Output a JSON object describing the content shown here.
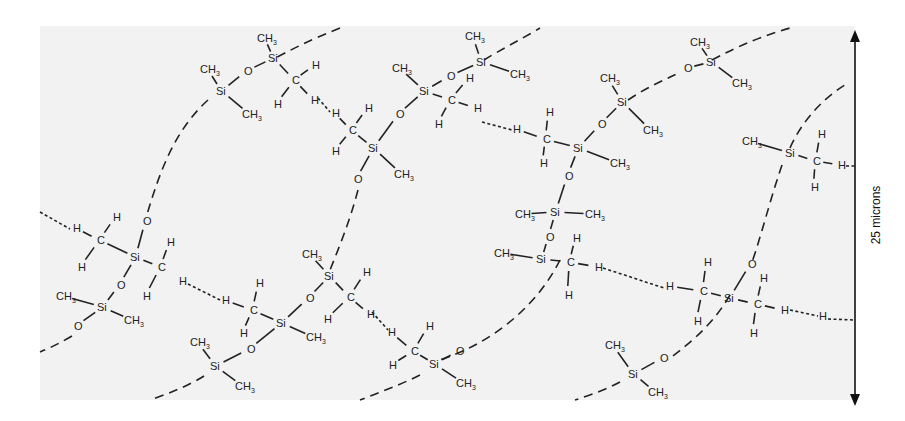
{
  "diagram": {
    "background_color": "#f2f2f2",
    "ink_color": "#222222",
    "scale_bar": {
      "label": "25 microns"
    },
    "atoms": [
      {
        "id": "a1",
        "t": "CH",
        "sub": "3",
        "x": 257,
        "y": 42
      },
      {
        "id": "a2",
        "t": "Si",
        "x": 268,
        "y": 62
      },
      {
        "id": "a3",
        "t": "O",
        "x": 244,
        "y": 75
      },
      {
        "id": "a4",
        "t": "CH",
        "sub": "3",
        "x": 200,
        "y": 73
      },
      {
        "id": "a5",
        "t": "Si",
        "x": 216,
        "y": 95
      },
      {
        "id": "a6",
        "t": "CH",
        "sub": "3",
        "x": 242,
        "y": 118
      },
      {
        "id": "a7",
        "t": "H",
        "x": 312,
        "y": 69
      },
      {
        "id": "a8",
        "t": "C",
        "x": 292,
        "y": 84
      },
      {
        "id": "a9",
        "t": "H",
        "x": 274,
        "y": 108
      },
      {
        "id": "a10",
        "t": "H",
        "x": 311,
        "y": 104
      },
      {
        "id": "b1",
        "t": "H",
        "x": 332,
        "y": 117
      },
      {
        "id": "b2",
        "t": "H",
        "x": 365,
        "y": 112
      },
      {
        "id": "b3",
        "t": "C",
        "x": 349,
        "y": 134
      },
      {
        "id": "b4",
        "t": "H",
        "x": 332,
        "y": 155
      },
      {
        "id": "b5",
        "t": "Si",
        "x": 368,
        "y": 152
      },
      {
        "id": "b6",
        "t": "CH",
        "sub": "3",
        "x": 394,
        "y": 178
      },
      {
        "id": "b7",
        "t": "O",
        "x": 354,
        "y": 183
      },
      {
        "id": "b8",
        "t": "CH",
        "sub": "3",
        "x": 392,
        "y": 72
      },
      {
        "id": "b9",
        "t": "Si",
        "x": 419,
        "y": 95
      },
      {
        "id": "b10",
        "t": "O",
        "x": 396,
        "y": 118
      },
      {
        "id": "b11",
        "t": "O",
        "x": 447,
        "y": 80
      },
      {
        "id": "b12",
        "t": "CH",
        "sub": "3",
        "x": 465,
        "y": 40
      },
      {
        "id": "b13",
        "t": "Si",
        "x": 476,
        "y": 66
      },
      {
        "id": "b14",
        "t": "CH",
        "sub": "3",
        "x": 510,
        "y": 78
      },
      {
        "id": "b15",
        "t": "H",
        "x": 466,
        "y": 82
      },
      {
        "id": "b16",
        "t": "C",
        "x": 448,
        "y": 104
      },
      {
        "id": "b17",
        "t": "H",
        "x": 435,
        "y": 128
      },
      {
        "id": "b18",
        "t": "H",
        "x": 474,
        "y": 112
      },
      {
        "id": "c1",
        "t": "H",
        "x": 513,
        "y": 133
      },
      {
        "id": "c2",
        "t": "H",
        "x": 546,
        "y": 116
      },
      {
        "id": "c3",
        "t": "C",
        "x": 543,
        "y": 143
      },
      {
        "id": "c4",
        "t": "H",
        "x": 540,
        "y": 167
      },
      {
        "id": "c5",
        "t": "Si",
        "x": 573,
        "y": 152
      },
      {
        "id": "c6",
        "t": "CH",
        "sub": "3",
        "x": 610,
        "y": 167
      },
      {
        "id": "c7",
        "t": "O",
        "x": 565,
        "y": 180
      },
      {
        "id": "c8",
        "t": "O",
        "x": 598,
        "y": 128
      },
      {
        "id": "c9",
        "t": "CH",
        "sub": "3",
        "x": 600,
        "y": 82
      },
      {
        "id": "c10",
        "t": "Si",
        "x": 617,
        "y": 106
      },
      {
        "id": "c11",
        "t": "CH",
        "sub": "3",
        "x": 643,
        "y": 134
      },
      {
        "id": "c12",
        "t": "O",
        "x": 684,
        "y": 72
      },
      {
        "id": "c13",
        "t": "CH",
        "sub": "3",
        "x": 690,
        "y": 46
      },
      {
        "id": "c14",
        "t": "Si",
        "x": 706,
        "y": 66
      },
      {
        "id": "c15",
        "t": "CH",
        "sub": "3",
        "x": 732,
        "y": 87
      },
      {
        "id": "d1",
        "t": "CH",
        "sub": "3",
        "x": 742,
        "y": 145
      },
      {
        "id": "d2",
        "t": "Si",
        "x": 785,
        "y": 157
      },
      {
        "id": "d3",
        "t": "H",
        "x": 818,
        "y": 138
      },
      {
        "id": "d4",
        "t": "C",
        "x": 813,
        "y": 165
      },
      {
        "id": "d5",
        "t": "H",
        "x": 811,
        "y": 191
      },
      {
        "id": "d6",
        "t": "H",
        "x": 838,
        "y": 169
      },
      {
        "id": "e1",
        "t": "CH",
        "sub": "3",
        "x": 515,
        "y": 218
      },
      {
        "id": "e2",
        "t": "Si",
        "x": 550,
        "y": 216
      },
      {
        "id": "e3",
        "t": "CH",
        "sub": "3",
        "x": 585,
        "y": 218
      },
      {
        "id": "e4",
        "t": "O",
        "x": 546,
        "y": 241
      },
      {
        "id": "e5",
        "t": "CH",
        "sub": "3",
        "x": 494,
        "y": 257
      },
      {
        "id": "e6",
        "t": "Si",
        "x": 536,
        "y": 263
      },
      {
        "id": "e7",
        "t": "H",
        "x": 573,
        "y": 242
      },
      {
        "id": "e8",
        "t": "C",
        "x": 567,
        "y": 266
      },
      {
        "id": "e9",
        "t": "H",
        "x": 565,
        "y": 299
      },
      {
        "id": "e10",
        "t": "H",
        "x": 595,
        "y": 271
      },
      {
        "id": "f1",
        "t": "H",
        "x": 666,
        "y": 290
      },
      {
        "id": "f2",
        "t": "H",
        "x": 704,
        "y": 266
      },
      {
        "id": "f3",
        "t": "C",
        "x": 700,
        "y": 295
      },
      {
        "id": "f4",
        "t": "H",
        "x": 694,
        "y": 325
      },
      {
        "id": "f5",
        "t": "Si",
        "x": 724,
        "y": 302
      },
      {
        "id": "f6",
        "t": "O",
        "x": 748,
        "y": 268
      },
      {
        "id": "f7",
        "t": "H",
        "x": 760,
        "y": 282
      },
      {
        "id": "f8",
        "t": "C",
        "x": 754,
        "y": 308
      },
      {
        "id": "f9",
        "t": "H",
        "x": 750,
        "y": 337
      },
      {
        "id": "f10",
        "t": "H",
        "x": 781,
        "y": 314
      },
      {
        "id": "f11",
        "t": "H",
        "x": 819,
        "y": 320
      },
      {
        "id": "f12",
        "t": "CH",
        "sub": "3",
        "x": 605,
        "y": 349
      },
      {
        "id": "f13",
        "t": "O",
        "x": 660,
        "y": 362
      },
      {
        "id": "f14",
        "t": "Si",
        "x": 628,
        "y": 378
      },
      {
        "id": "f15",
        "t": "CH",
        "sub": "3",
        "x": 648,
        "y": 396
      },
      {
        "id": "g1",
        "t": "H",
        "x": 73,
        "y": 232
      },
      {
        "id": "g2",
        "t": "H",
        "x": 113,
        "y": 221
      },
      {
        "id": "g3",
        "t": "C",
        "x": 97,
        "y": 244
      },
      {
        "id": "g4",
        "t": "H",
        "x": 78,
        "y": 271
      },
      {
        "id": "g5",
        "t": "O",
        "x": 143,
        "y": 225
      },
      {
        "id": "g6",
        "t": "Si",
        "x": 130,
        "y": 261
      },
      {
        "id": "g7",
        "t": "H",
        "x": 167,
        "y": 246
      },
      {
        "id": "g8",
        "t": "C",
        "x": 158,
        "y": 271
      },
      {
        "id": "g9",
        "t": "H",
        "x": 143,
        "y": 300
      },
      {
        "id": "g10",
        "t": "O",
        "x": 117,
        "y": 289
      },
      {
        "id": "g11",
        "t": "CH",
        "sub": "3",
        "x": 56,
        "y": 300
      },
      {
        "id": "g12",
        "t": "Si",
        "x": 97,
        "y": 311
      },
      {
        "id": "g13",
        "t": "CH",
        "sub": "3",
        "x": 124,
        "y": 324
      },
      {
        "id": "g14",
        "t": "O",
        "x": 74,
        "y": 330
      },
      {
        "id": "h1",
        "t": "H",
        "x": 179,
        "y": 285
      },
      {
        "id": "h2",
        "t": "H",
        "x": 222,
        "y": 304
      },
      {
        "id": "h3",
        "t": "H",
        "x": 256,
        "y": 287
      },
      {
        "id": "h4",
        "t": "C",
        "x": 250,
        "y": 314
      },
      {
        "id": "h5",
        "t": "H",
        "x": 240,
        "y": 337
      },
      {
        "id": "h6",
        "t": "Si",
        "x": 276,
        "y": 327
      },
      {
        "id": "h7",
        "t": "CH",
        "sub": "3",
        "x": 306,
        "y": 341
      },
      {
        "id": "h8",
        "t": "O",
        "x": 247,
        "y": 353
      },
      {
        "id": "h9",
        "t": "CH",
        "sub": "3",
        "x": 190,
        "y": 346
      },
      {
        "id": "h10",
        "t": "Si",
        "x": 210,
        "y": 370
      },
      {
        "id": "h11",
        "t": "CH",
        "sub": "3",
        "x": 235,
        "y": 390
      },
      {
        "id": "h12",
        "t": "O",
        "x": 306,
        "y": 302
      },
      {
        "id": "h13",
        "t": "CH",
        "sub": "3",
        "x": 302,
        "y": 258
      },
      {
        "id": "h14",
        "t": "Si",
        "x": 324,
        "y": 280
      },
      {
        "id": "h15",
        "t": "H",
        "x": 363,
        "y": 276
      },
      {
        "id": "h16",
        "t": "C",
        "x": 347,
        "y": 301
      },
      {
        "id": "h17",
        "t": "H",
        "x": 324,
        "y": 323
      },
      {
        "id": "h18",
        "t": "H",
        "x": 367,
        "y": 318
      },
      {
        "id": "i1",
        "t": "H",
        "x": 388,
        "y": 336
      },
      {
        "id": "i2",
        "t": "H",
        "x": 426,
        "y": 330
      },
      {
        "id": "i3",
        "t": "C",
        "x": 411,
        "y": 355
      },
      {
        "id": "i4",
        "t": "H",
        "x": 389,
        "y": 369
      },
      {
        "id": "i5",
        "t": "Si",
        "x": 429,
        "y": 368
      },
      {
        "id": "i6",
        "t": "CH",
        "sub": "3",
        "x": 456,
        "y": 387
      },
      {
        "id": "i7",
        "t": "O",
        "x": 456,
        "y": 355
      }
    ],
    "bonds": [
      [
        "a1",
        "a2"
      ],
      [
        "a2",
        "a3"
      ],
      [
        "a3",
        "a5"
      ],
      [
        "a4",
        "a5"
      ],
      [
        "a5",
        "a6"
      ],
      [
        "a2",
        "a8"
      ],
      [
        "a8",
        "a7"
      ],
      [
        "a8",
        "a9"
      ],
      [
        "a8",
        "a10"
      ],
      [
        "b2",
        "b3"
      ],
      [
        "b1",
        "b3"
      ],
      [
        "b3",
        "b4"
      ],
      [
        "b3",
        "b5"
      ],
      [
        "b5",
        "b6"
      ],
      [
        "b5",
        "b7"
      ],
      [
        "b5",
        "b10"
      ],
      [
        "b10",
        "b9"
      ],
      [
        "b8",
        "b9"
      ],
      [
        "b9",
        "b11"
      ],
      [
        "b11",
        "b13"
      ],
      [
        "b12",
        "b13"
      ],
      [
        "b13",
        "b14"
      ],
      [
        "b9",
        "b16"
      ],
      [
        "b16",
        "b15"
      ],
      [
        "b16",
        "b17"
      ],
      [
        "b16",
        "b18"
      ],
      [
        "c1",
        "c3"
      ],
      [
        "c2",
        "c3"
      ],
      [
        "c3",
        "c4"
      ],
      [
        "c3",
        "c5"
      ],
      [
        "c5",
        "c6"
      ],
      [
        "c5",
        "c7"
      ],
      [
        "c5",
        "c8"
      ],
      [
        "c8",
        "c10"
      ],
      [
        "c9",
        "c10"
      ],
      [
        "c10",
        "c11"
      ],
      [
        "c12",
        "c14"
      ],
      [
        "c13",
        "c14"
      ],
      [
        "c14",
        "c15"
      ],
      [
        "d1",
        "d2"
      ],
      [
        "d2",
        "d4"
      ],
      [
        "d3",
        "d4"
      ],
      [
        "d4",
        "d5"
      ],
      [
        "d4",
        "d6"
      ],
      [
        "c7",
        "e2"
      ],
      [
        "e1",
        "e2"
      ],
      [
        "e2",
        "e3"
      ],
      [
        "e2",
        "e4"
      ],
      [
        "e4",
        "e6"
      ],
      [
        "e5",
        "e6"
      ],
      [
        "e6",
        "e8"
      ],
      [
        "e7",
        "e8"
      ],
      [
        "e8",
        "e9"
      ],
      [
        "e8",
        "e10"
      ],
      [
        "f1",
        "f3"
      ],
      [
        "f2",
        "f3"
      ],
      [
        "f3",
        "f4"
      ],
      [
        "f3",
        "f5"
      ],
      [
        "f5",
        "f6"
      ],
      [
        "f5",
        "f8"
      ],
      [
        "f7",
        "f8"
      ],
      [
        "f8",
        "f9"
      ],
      [
        "f8",
        "f10"
      ],
      [
        "f12",
        "f14"
      ],
      [
        "f13",
        "f14"
      ],
      [
        "f14",
        "f15"
      ],
      [
        "g1",
        "g3"
      ],
      [
        "g2",
        "g3"
      ],
      [
        "g3",
        "g4"
      ],
      [
        "g3",
        "g6"
      ],
      [
        "g5",
        "g6"
      ],
      [
        "g6",
        "g8"
      ],
      [
        "g7",
        "g8"
      ],
      [
        "g8",
        "g9"
      ],
      [
        "g6",
        "g10"
      ],
      [
        "g10",
        "g12"
      ],
      [
        "g11",
        "g12"
      ],
      [
        "g12",
        "g13"
      ],
      [
        "g12",
        "g14"
      ],
      [
        "h2",
        "h4"
      ],
      [
        "h3",
        "h4"
      ],
      [
        "h4",
        "h5"
      ],
      [
        "h4",
        "h6"
      ],
      [
        "h6",
        "h7"
      ],
      [
        "h6",
        "h8"
      ],
      [
        "h8",
        "h10"
      ],
      [
        "h9",
        "h10"
      ],
      [
        "h10",
        "h11"
      ],
      [
        "h6",
        "h12"
      ],
      [
        "h12",
        "h14"
      ],
      [
        "h13",
        "h14"
      ],
      [
        "h14",
        "h16"
      ],
      [
        "h15",
        "h16"
      ],
      [
        "h16",
        "h17"
      ],
      [
        "h16",
        "h18"
      ],
      [
        "i1",
        "i3"
      ],
      [
        "i2",
        "i3"
      ],
      [
        "i3",
        "i4"
      ],
      [
        "i3",
        "i5"
      ],
      [
        "i5",
        "i6"
      ],
      [
        "i5",
        "i7"
      ]
    ],
    "chains": [
      "M 340 28 C 310 40 290 50 272 60",
      "M 208 100 C 175 130 160 170 146 218",
      "M 72 336 C 60 343 50 348 40 352",
      "M 358 190 C 350 220 342 240 330 270",
      "M 484 60 C 500 50 520 40 540 28",
      "M 628 100 C 650 85 670 78 680 72",
      "M 712 60 C 740 45 765 35 790 28",
      "M 560 260 C 540 300 500 340 440 360",
      "M 420 375 C 400 385 380 392 360 400",
      "M 730 295 C 710 330 680 350 668 360",
      "M 620 382 C 605 390 590 395 575 400",
      "M 790 148 C 800 125 820 100 845 85",
      "M 782 165 C 770 200 760 240 752 262",
      "M 204 376 C 190 385 170 393 150 400"
    ],
    "hbonds": [
      "M 318 98 L 330 112",
      "M 482 122 L 512 130",
      "M 40 212 L 70 229",
      "M 188 284 L 220 300",
      "M 372 312 L 388 330",
      "M 603 268 L 664 288",
      "M 790 310 L 818 316",
      "M 828 319 L 855 320",
      "M 846 166 L 855 166"
    ]
  }
}
